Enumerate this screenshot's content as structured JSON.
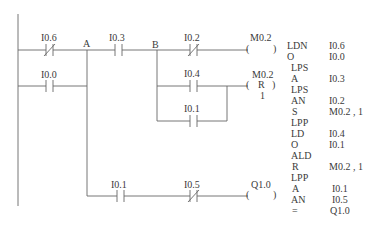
{
  "diagram": {
    "type": "ladder-logic",
    "nodes": {
      "A": "A",
      "B": "B"
    },
    "rungs": [
      {
        "id": "rung1",
        "contacts": [
          {
            "address": "I0.6",
            "type": "normally-closed"
          },
          {
            "address": "I0.3",
            "type": "normally-open"
          },
          {
            "address": "I0.2",
            "type": "normally-closed"
          }
        ],
        "coil": {
          "address": "M0.2",
          "type": "output",
          "symbol": "(   )"
        }
      },
      {
        "id": "rung2-parallel",
        "contacts": [
          {
            "address": "I0.0",
            "type": "normally-open"
          }
        ]
      },
      {
        "id": "rung3",
        "contacts": [
          {
            "address": "I0.4",
            "type": "normally-open"
          }
        ],
        "coil": {
          "address": "M0.2",
          "type": "reset",
          "symbol": "( R )",
          "count": "1"
        }
      },
      {
        "id": "rung3-parallel",
        "contacts": [
          {
            "address": "I0.1",
            "type": "normally-open"
          }
        ]
      },
      {
        "id": "rung4",
        "contacts": [
          {
            "address": "I0.1",
            "type": "normally-open"
          },
          {
            "address": "I0.5",
            "type": "normally-closed"
          }
        ],
        "coil": {
          "address": "Q1.0",
          "type": "output",
          "symbol": "(   )"
        }
      }
    ]
  },
  "labels": {
    "i06": "I0.6",
    "i03": "I0.3",
    "i02": "I0.2",
    "m02": "M0.2",
    "i00": "I0.0",
    "i04": "I0.4",
    "m02r": "M0.2",
    "r": "R",
    "r_count": "1",
    "i01a": "I0.1",
    "i01b": "I0.1",
    "i05": "I0.5",
    "q10": "Q1.0",
    "node_a": "A",
    "node_b": "B",
    "coil_open": "(",
    "coil_close": ")"
  },
  "instruction_list": [
    {
      "op": "LDN",
      "operand": "I0.6"
    },
    {
      "op": "O",
      "operand": "I0.0"
    },
    {
      "op": "LPS",
      "operand": ""
    },
    {
      "op": "A",
      "operand": "I0.3"
    },
    {
      "op": "LPS",
      "operand": ""
    },
    {
      "op": "AN",
      "operand": "I0.2"
    },
    {
      "op": "S",
      "operand": "M0.2 , 1"
    },
    {
      "op": "LPP",
      "operand": ""
    },
    {
      "op": "LD",
      "operand": "I0.4"
    },
    {
      "op": "O",
      "operand": "I0.1"
    },
    {
      "op": "ALD",
      "operand": ""
    },
    {
      "op": "R",
      "operand": "M0.2 , 1"
    },
    {
      "op": "LPP",
      "operand": ""
    },
    {
      "op": "A",
      "operand": "I0.1"
    },
    {
      "op": "AN",
      "operand": "I0.5"
    },
    {
      "op": "=",
      "operand": "Q1.0"
    }
  ],
  "colors": {
    "line": "#555555",
    "text": "#3a3a3a",
    "background": "#ffffff"
  }
}
